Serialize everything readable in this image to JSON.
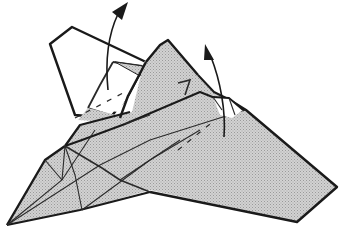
{
  "diagram": {
    "title": "Paper airplane origami step: open flaps upward",
    "colors": {
      "background": "#ffffff",
      "paper_shaded": "#c8c8c8",
      "paper_white": "#ffffff",
      "line": "#1a1a1a"
    },
    "parts": [
      {
        "id": "left-flap",
        "label": "Left wing flap (white side)"
      },
      {
        "id": "center-fin",
        "label": "Center fin"
      },
      {
        "id": "right-flap",
        "label": "Right small flap"
      },
      {
        "id": "nose",
        "label": "Nose"
      },
      {
        "id": "right-wing",
        "label": "Right wing"
      }
    ],
    "arrows": [
      {
        "id": "arrow-left",
        "meaning": "lift flap up"
      },
      {
        "id": "arrow-right",
        "meaning": "lift flap up"
      }
    ],
    "fold_lines": [
      {
        "id": "valley-left",
        "style": "dashed"
      },
      {
        "id": "valley-right",
        "style": "dashed"
      }
    ]
  }
}
